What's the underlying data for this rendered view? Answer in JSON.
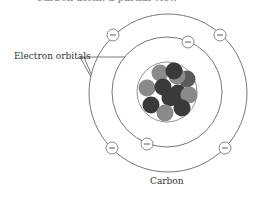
{
  "caption_top": "Carbon atom: a partial view",
  "labels": {
    "electron_orbitals": "Electron orbitals",
    "element": "Carbon"
  },
  "electron_symbol": "−",
  "colors": {
    "orbit": "#555555",
    "nucleus_outline": "#777777",
    "particle_dark": "#3a3a3a",
    "particle_light": "#8a8a8a"
  },
  "atom": {
    "nucleus_particles": 12,
    "orbitals": 2,
    "electrons": [
      {
        "orbital": "outer",
        "x": 113,
        "y": 35
      },
      {
        "orbital": "outer",
        "x": 220,
        "y": 35
      },
      {
        "orbital": "outer",
        "x": 112,
        "y": 148
      },
      {
        "orbital": "outer",
        "x": 225,
        "y": 148
      },
      {
        "orbital": "inner",
        "x": 188,
        "y": 42
      },
      {
        "orbital": "inner",
        "x": 147,
        "y": 144
      }
    ]
  }
}
